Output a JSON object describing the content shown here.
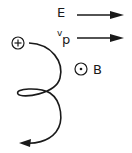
{
  "diagram": {
    "labels": {
      "electric_field": "E",
      "velocity_v": "v",
      "velocity_sub": "p",
      "magnetic_field": "B",
      "charge_sign": "+"
    },
    "elements": [
      {
        "type": "arrow",
        "label": "E",
        "direction": "right"
      },
      {
        "type": "arrow",
        "label": "v_p",
        "direction": "right"
      },
      {
        "type": "symbol",
        "label": "B",
        "meaning": "out of page (dot in circle)"
      },
      {
        "type": "particle",
        "charge": "+",
        "path": "helical/cycloidal trajectory with one loop, ending in arrow pointing left"
      }
    ],
    "colors": {
      "ink": "#1a1a1a",
      "background": "#ffffff"
    }
  }
}
